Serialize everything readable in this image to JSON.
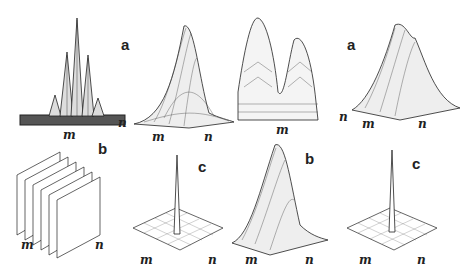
{
  "figure": {
    "panels": [
      {
        "id": "p1",
        "label": "",
        "x_axis": "m",
        "y_axis": "n",
        "shape": "multi-peak comb (central peak tallest)"
      },
      {
        "id": "p2",
        "label": "a",
        "x_axis": "m",
        "y_axis": "n",
        "shape": "single gaussian-like hump"
      },
      {
        "id": "p3",
        "label": "",
        "x_axis": "m",
        "y_axis": "n",
        "shape": "twin peaks"
      },
      {
        "id": "p4",
        "label": "a",
        "x_axis": "m",
        "y_axis": "n",
        "shape": "multi-ridge hump"
      },
      {
        "id": "p5",
        "label": "b",
        "x_axis": "m",
        "y_axis": "n",
        "shape": "parallel sheet stack"
      },
      {
        "id": "p6",
        "label": "c",
        "x_axis": "m",
        "y_axis": "n",
        "shape": "single spike on flat grid"
      },
      {
        "id": "p7",
        "label": "b",
        "x_axis": "m",
        "y_axis": "n",
        "shape": "gaussian-like hump"
      },
      {
        "id": "p8",
        "label": "c",
        "x_axis": "m",
        "y_axis": "n",
        "shape": "single spike on flat grid"
      }
    ],
    "colors": {
      "ink": "#222222",
      "background": "#ffffff"
    }
  }
}
